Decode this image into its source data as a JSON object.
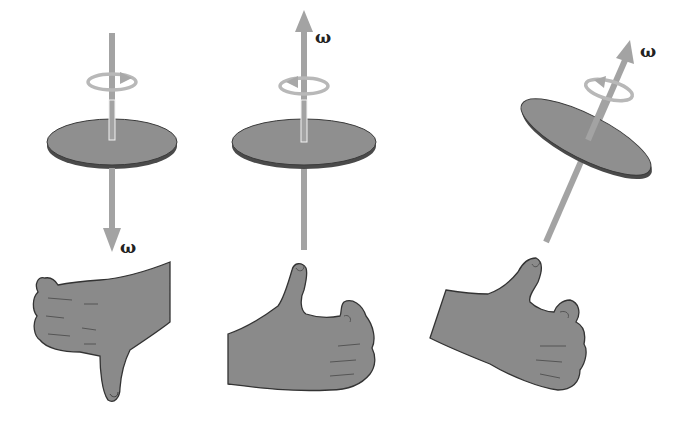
{
  "diagram": {
    "colors": {
      "disk_top": "#8f8f8f",
      "disk_edge": "#4a4a4a",
      "axis_arrow": "#a3a3a3",
      "rotation_arrow": "#b5b5b5",
      "hand": "#8a8a8a",
      "hand_outline": "#333333"
    },
    "panels": [
      {
        "id": "left",
        "vector_label": "ω",
        "direction": "down",
        "hand": "thumb-down",
        "rotation": "clockwise (viewed from above)"
      },
      {
        "id": "middle",
        "vector_label": "ω",
        "direction": "up",
        "hand": "thumb-up",
        "rotation": "counterclockwise (viewed from above)"
      },
      {
        "id": "right",
        "vector_label": "ω",
        "direction": "up-tilted",
        "hand": "thumb-up-tilted",
        "rotation": "counterclockwise (viewed from above)"
      }
    ]
  }
}
